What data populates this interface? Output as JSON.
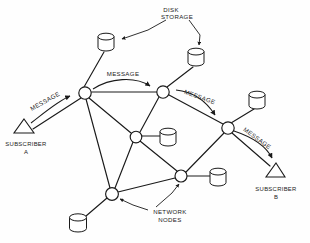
{
  "diagram": {
    "stroke_color": "#1a1a1a",
    "background_color": "#ffffff",
    "labels": {
      "disk_storage_line1": "DISK",
      "disk_storage_line2": "STORAGE",
      "network_nodes_line1": "NETWORK",
      "network_nodes_line2": "NODES",
      "subscriber_a_line1": "SUBSCRIBER",
      "subscriber_a_line2": "A",
      "subscriber_b_line1": "SUBSCRIBER",
      "subscriber_b_line2": "B",
      "message_left": "MESSAGE",
      "message_center": "MESSAGE",
      "message_right_upper": "MESSAGE",
      "message_right_lower": "MESSAGE"
    },
    "nodes": [
      {
        "id": "n1",
        "name": "network-node-upper-left",
        "x": 85,
        "y": 93,
        "r": 6.2
      },
      {
        "id": "n2",
        "name": "network-node-upper-right",
        "x": 163,
        "y": 92,
        "r": 6.2
      },
      {
        "id": "n3",
        "name": "network-node-center",
        "x": 136,
        "y": 137,
        "r": 5.8
      },
      {
        "id": "n4",
        "name": "network-node-right",
        "x": 228,
        "y": 128,
        "r": 6.2
      },
      {
        "id": "n5",
        "name": "network-node-lower-right",
        "x": 181,
        "y": 176,
        "r": 6.0
      },
      {
        "id": "n6",
        "name": "network-node-lower-left",
        "x": 112,
        "y": 194,
        "r": 6.4
      }
    ],
    "disks": [
      {
        "name": "disk-storage-top-left",
        "cx": 106,
        "cy": 40,
        "rx": 8,
        "ry": 3.4,
        "h": 11
      },
      {
        "name": "disk-storage-top-right",
        "cx": 196,
        "cy": 55,
        "rx": 8,
        "ry": 3.4,
        "h": 11
      },
      {
        "name": "disk-storage-center",
        "cx": 168,
        "cy": 135,
        "rx": 8,
        "ry": 3.4,
        "h": 11
      },
      {
        "name": "disk-storage-upper-right",
        "cx": 257,
        "cy": 98,
        "rx": 8,
        "ry": 3.4,
        "h": 11
      },
      {
        "name": "disk-storage-lower-right",
        "cx": 218,
        "cy": 176,
        "rx": 8,
        "ry": 3.4,
        "h": 11
      },
      {
        "name": "disk-storage-bottom-left",
        "cx": 78,
        "cy": 222,
        "rx": 8.5,
        "ry": 3.6,
        "h": 11
      }
    ],
    "subscribers": [
      {
        "name": "subscriber-a-terminal",
        "x": 24,
        "y": 128
      },
      {
        "name": "subscriber-b-terminal",
        "x": 276,
        "y": 172
      }
    ],
    "links": [
      {
        "from": "n1",
        "to": "n2"
      },
      {
        "from": "n1",
        "to": "n3"
      },
      {
        "from": "n1",
        "to": "n6"
      },
      {
        "from": "n2",
        "to": "n3"
      },
      {
        "from": "n2",
        "to": "n4"
      },
      {
        "from": "n3",
        "to": "n6"
      },
      {
        "from": "n3",
        "to": "n5"
      },
      {
        "from": "n4",
        "to": "n5"
      },
      {
        "from": "n5",
        "to": "n6"
      }
    ]
  }
}
